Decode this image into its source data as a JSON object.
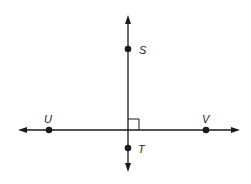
{
  "diagram": {
    "type": "geometry-perpendicular-lines",
    "colors": {
      "line": "#1a1a1a",
      "background": "#ffffff"
    },
    "lines": [
      {
        "name": "line-ST",
        "orientation": "vertical",
        "x1": 128,
        "y1": 15,
        "x2": 128,
        "y2": 172,
        "arrows": "both"
      },
      {
        "name": "line-UV",
        "orientation": "horizontal",
        "x1": 18,
        "y1": 130,
        "x2": 240,
        "y2": 130,
        "arrows": "both"
      }
    ],
    "right_angle_marker": {
      "x": 128,
      "y": 119,
      "size": 11
    },
    "points": [
      {
        "label": "S",
        "cx": 128,
        "cy": 49,
        "lx": 139,
        "ly": 54
      },
      {
        "label": "T",
        "cx": 128,
        "cy": 148,
        "lx": 138,
        "ly": 153
      },
      {
        "label": "U",
        "cx": 49,
        "cy": 130,
        "lx": 44,
        "ly": 123
      },
      {
        "label": "V",
        "cx": 206,
        "cy": 130,
        "lx": 202,
        "ly": 123
      }
    ]
  }
}
